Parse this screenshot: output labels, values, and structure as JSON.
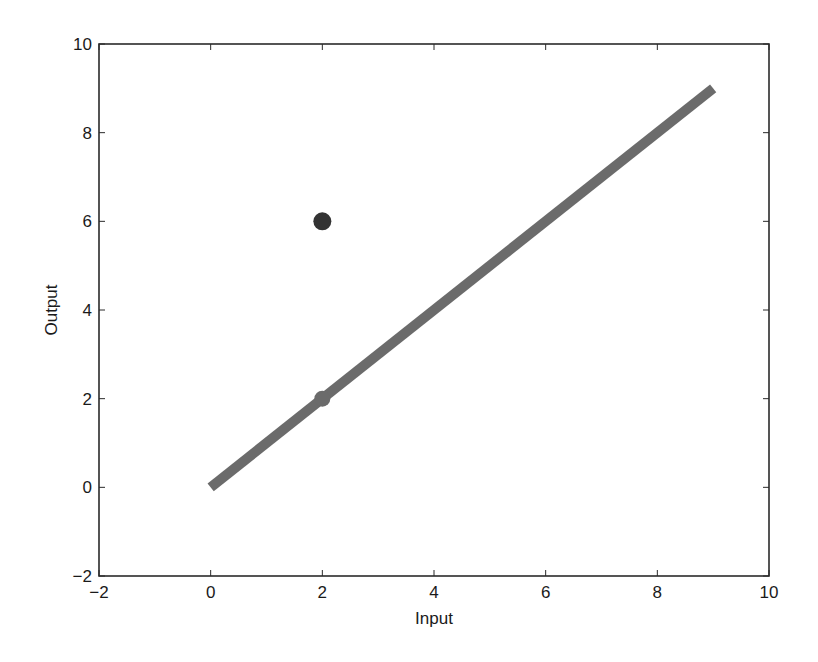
{
  "chart_data": {
    "type": "scatter",
    "title": "",
    "xlabel": "Input",
    "ylabel": "Output",
    "xlim": [
      -2,
      10
    ],
    "ylim": [
      -2,
      10
    ],
    "grid": false,
    "legend": null,
    "xticks": [
      -2,
      0,
      2,
      4,
      6,
      8,
      10
    ],
    "yticks": [
      -2,
      0,
      2,
      4,
      6,
      8,
      10
    ],
    "xtick_labels": [
      "−2",
      "0",
      "2",
      "4",
      "6",
      "8",
      "10"
    ],
    "ytick_labels": [
      "−2",
      "0",
      "2",
      "4",
      "6",
      "8",
      "10"
    ],
    "series": [
      {
        "name": "line",
        "kind": "line",
        "x": [
          0,
          9
        ],
        "y": [
          0,
          9
        ],
        "color": "#6b6b6b",
        "linewidth": 10
      },
      {
        "name": "point-on-line",
        "kind": "scatter",
        "x": [
          2
        ],
        "y": [
          2
        ],
        "color": "#6b6b6b",
        "radius": 8
      },
      {
        "name": "point-off-line",
        "kind": "scatter",
        "x": [
          2
        ],
        "y": [
          6
        ],
        "color": "#333333",
        "radius": 9
      }
    ]
  },
  "colors": {
    "axis": "#2b2b2b",
    "text": "#1a1a1a",
    "background": "#ffffff"
  }
}
